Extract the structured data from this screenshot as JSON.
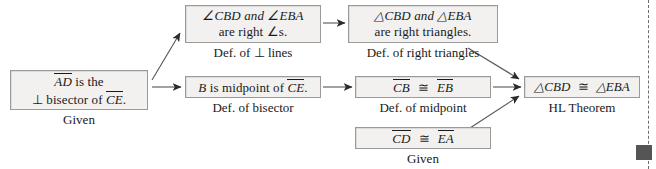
{
  "diagram": {
    "type": "flow-proof",
    "colors": {
      "box_fill": "#f2f1f0",
      "box_border": "#9a9a9a",
      "text": "#1a1a1a",
      "arrow": "#333333",
      "rule": "#6d6d6d",
      "corner_mark": "#555555"
    }
  },
  "nodes": {
    "given_bisector": {
      "line1_seg": "AD",
      "line1_rest": " is the",
      "line2_perp": "⊥",
      "line2_mid": " bisector of ",
      "line2_seg": "CE",
      "line2_end": ".",
      "reason": "Given"
    },
    "right_angles": {
      "line1": "∠CBD and ∠EBA",
      "line2": "are right ∠s.",
      "reason": "Def. of ⊥ lines"
    },
    "right_triangles": {
      "line1": "△CBD and △EBA",
      "line2": "are right triangles.",
      "reason": "Def. of right triangles"
    },
    "midpoint": {
      "line1_pre": "B",
      "line1_mid": " is midpoint of ",
      "line1_seg": "CE",
      "line1_end": ".",
      "reason": "Def. of bisector"
    },
    "cb_eb": {
      "seg1": "CB",
      "symbol": "≅",
      "seg2": "EB",
      "reason": "Def. of midpoint"
    },
    "cd_ea": {
      "seg1": "CD",
      "symbol": "≅",
      "seg2": "EA",
      "reason": "Given"
    },
    "conclusion": {
      "tri1": "△CBD",
      "symbol": "≅",
      "tri2": "△EBA",
      "reason": "HL Theorem"
    }
  },
  "edges": [
    {
      "from": "given_bisector",
      "to": "right_angles",
      "style": "diagonal-up"
    },
    {
      "from": "given_bisector",
      "to": "midpoint",
      "style": "horizontal"
    },
    {
      "from": "right_angles",
      "to": "right_triangles",
      "style": "horizontal"
    },
    {
      "from": "midpoint",
      "to": "cb_eb",
      "style": "horizontal"
    },
    {
      "from": "right_triangles",
      "to": "conclusion",
      "style": "diagonal-down"
    },
    {
      "from": "cb_eb",
      "to": "conclusion",
      "style": "horizontal"
    },
    {
      "from": "cd_ea",
      "to": "conclusion",
      "style": "diagonal-up"
    }
  ]
}
